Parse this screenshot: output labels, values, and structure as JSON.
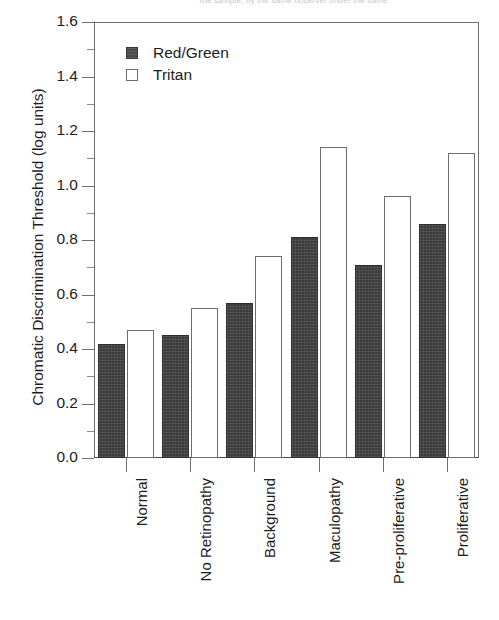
{
  "caption_fragment": "the sample, by the same observer under the same",
  "chart_data": {
    "type": "bar",
    "title": "",
    "xlabel": "",
    "ylabel": "Chromatic Discrimination Threshold (log units)",
    "ylim": [
      0.0,
      1.6
    ],
    "ytick_step": 0.2,
    "yminor_step": 0.1,
    "grid": false,
    "legend_position": "top-left",
    "categories": [
      "Normal",
      "No Retinopathy",
      "Background",
      "Maculopathy",
      "Pre-proliferative",
      "Proliferative"
    ],
    "series": [
      {
        "name": "Red/Green",
        "color": "#3b3b3b",
        "values": [
          0.42,
          0.45,
          0.57,
          0.81,
          0.71,
          0.86
        ]
      },
      {
        "name": "Tritan",
        "color": "#ffffff",
        "values": [
          0.47,
          0.55,
          0.74,
          1.14,
          0.96,
          1.12
        ]
      }
    ],
    "ytick_labels": [
      "0.0",
      "0.2",
      "0.4",
      "0.6",
      "0.8",
      "1.0",
      "1.2",
      "1.4",
      "1.6"
    ]
  }
}
